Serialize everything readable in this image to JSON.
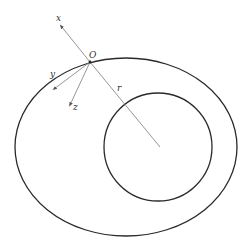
{
  "diagram": {
    "labels": {
      "x_axis": "x",
      "y_axis": "y",
      "z_axis": "z",
      "origin": "O",
      "radius": "r"
    },
    "colors": {
      "outline": "#2a2a2a",
      "axis": "#8a8a8a",
      "background": "#ffffff"
    },
    "outer_ellipse": {
      "cx": 126,
      "cy": 147,
      "rx": 111,
      "ry": 89
    },
    "inner_circle": {
      "cx": 158,
      "cy": 147,
      "r": 54
    },
    "origin_point": {
      "x": 90,
      "y": 62
    }
  }
}
